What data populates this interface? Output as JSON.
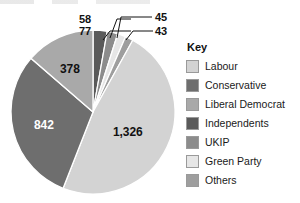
{
  "chart_data": {
    "type": "pie",
    "title": "",
    "total": 2769,
    "categories": [
      "Labour",
      "Conservative",
      "Liberal Democrat",
      "Independents",
      "UKIP",
      "Green Party",
      "Others"
    ],
    "values": [
      1326,
      842,
      378,
      77,
      58,
      45,
      43
    ],
    "value_labels": [
      "1,326",
      "842",
      "378",
      "77",
      "58",
      "45",
      "43"
    ],
    "colors": [
      "#d3d3d3",
      "#6e6e6e",
      "#a9a9a9",
      "#5a5a5a",
      "#8c8c8c",
      "#e6e6e6",
      "#9e9e9e"
    ],
    "legend_position": "right",
    "legend_title": "Key",
    "grid": false,
    "slices": [
      {
        "label": "Independents",
        "value": 77,
        "display": "77",
        "color": "#5a5a5a",
        "callout": true,
        "label_color": "dark"
      },
      {
        "label": "UKIP",
        "value": 58,
        "display": "58",
        "color": "#8c8c8c",
        "callout": true,
        "label_color": "dark"
      },
      {
        "label": "Green Party",
        "value": 45,
        "display": "45",
        "color": "#e6e6e6",
        "callout": true,
        "label_color": "dark"
      },
      {
        "label": "Others",
        "value": 43,
        "display": "43",
        "color": "#9e9e9e",
        "callout": true,
        "label_color": "dark"
      },
      {
        "label": "Labour",
        "value": 1326,
        "display": "1,326",
        "color": "#d3d3d3",
        "callout": false,
        "label_color": "dark"
      },
      {
        "label": "Conservative",
        "value": 842,
        "display": "842",
        "color": "#6e6e6e",
        "callout": false,
        "label_color": "light"
      },
      {
        "label": "Liberal Democrat",
        "value": 378,
        "display": "378",
        "color": "#a9a9a9",
        "callout": false,
        "label_color": "dark"
      }
    ]
  },
  "legend": {
    "title": "Key",
    "items": [
      {
        "label": "Labour",
        "color": "#d3d3d3"
      },
      {
        "label": "Conservative",
        "color": "#6e6e6e"
      },
      {
        "label": "Liberal Democrat",
        "color": "#a9a9a9"
      },
      {
        "label": "Independents",
        "color": "#5a5a5a"
      },
      {
        "label": "UKIP",
        "color": "#8c8c8c"
      },
      {
        "label": "Green Party",
        "color": "#e6e6e6"
      },
      {
        "label": "Others",
        "color": "#9e9e9e"
      }
    ]
  },
  "callout_labels": {
    "top_left_upper": "58",
    "top_left_lower": "77",
    "top_right_upper": "45",
    "top_right_lower": "43"
  },
  "inner_labels": {
    "labour": "1,326",
    "conservative": "842",
    "liberal_democrat": "378"
  }
}
